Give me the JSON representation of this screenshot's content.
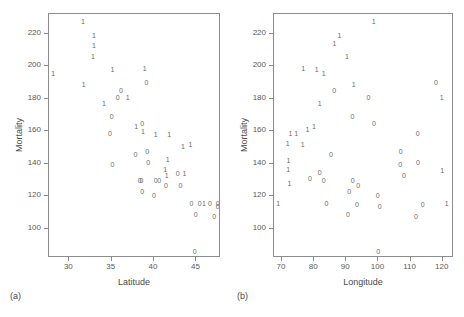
{
  "figure": {
    "background": "#ffffff",
    "axis_color": "#8c8c8c",
    "marker_color": "#6b6b6b",
    "text_color": "#4a4a4a"
  },
  "panels": [
    {
      "key": "a",
      "label": "(a)"
    },
    {
      "key": "b",
      "label": "(b)"
    }
  ],
  "chart_data": [
    {
      "type": "scatter",
      "panel": "(a)",
      "title": "",
      "xlabel": "Latitude",
      "ylabel": "Mortality",
      "xlim": [
        27.6,
        47.9
      ],
      "ylim": [
        82,
        232
      ],
      "xticks": [
        30,
        35,
        40,
        45
      ],
      "xticklabels": [
        "30",
        "35",
        "40",
        "45"
      ],
      "yticks": [
        100,
        120,
        140,
        160,
        180,
        200,
        220
      ],
      "yticklabels": [
        "100",
        "120",
        "140",
        "160",
        "180",
        "200",
        "220"
      ],
      "grid": false,
      "legend": "none",
      "marker_encoding": {
        "1": "group 1 (text glyph '1')",
        "0": "group 0 (text glyph '0')"
      },
      "points": [
        {
          "x": 31.6,
          "y": 228,
          "m": "1"
        },
        {
          "x": 32.9,
          "y": 219,
          "m": "1"
        },
        {
          "x": 32.9,
          "y": 213,
          "m": "1"
        },
        {
          "x": 32.8,
          "y": 206,
          "m": "1"
        },
        {
          "x": 28.1,
          "y": 196,
          "m": "1"
        },
        {
          "x": 35.1,
          "y": 198,
          "m": "1"
        },
        {
          "x": 38.9,
          "y": 199,
          "m": "1"
        },
        {
          "x": 31.7,
          "y": 189,
          "m": "1"
        },
        {
          "x": 39.1,
          "y": 190,
          "m": "0"
        },
        {
          "x": 36.1,
          "y": 185,
          "m": "0"
        },
        {
          "x": 35.7,
          "y": 181,
          "m": "0"
        },
        {
          "x": 36.9,
          "y": 181,
          "m": "1"
        },
        {
          "x": 34.1,
          "y": 177,
          "m": "1"
        },
        {
          "x": 35.0,
          "y": 169,
          "m": "0"
        },
        {
          "x": 38.6,
          "y": 165,
          "m": "0"
        },
        {
          "x": 37.9,
          "y": 163,
          "m": "1"
        },
        {
          "x": 38.7,
          "y": 160,
          "m": "1"
        },
        {
          "x": 34.8,
          "y": 159,
          "m": "0"
        },
        {
          "x": 40.2,
          "y": 158,
          "m": "1"
        },
        {
          "x": 41.8,
          "y": 158,
          "m": "1"
        },
        {
          "x": 43.4,
          "y": 151,
          "m": "1"
        },
        {
          "x": 44.3,
          "y": 152,
          "m": "1"
        },
        {
          "x": 39.2,
          "y": 148,
          "m": "0"
        },
        {
          "x": 37.8,
          "y": 146,
          "m": "0"
        },
        {
          "x": 41.6,
          "y": 143,
          "m": "1"
        },
        {
          "x": 39.3,
          "y": 141,
          "m": "0"
        },
        {
          "x": 35.1,
          "y": 140,
          "m": "0"
        },
        {
          "x": 41.3,
          "y": 137,
          "m": "1"
        },
        {
          "x": 42.8,
          "y": 134,
          "m": "0"
        },
        {
          "x": 43.6,
          "y": 134,
          "m": "1"
        },
        {
          "x": 41.5,
          "y": 133,
          "m": "1"
        },
        {
          "x": 38.3,
          "y": 130,
          "m": "0"
        },
        {
          "x": 40.2,
          "y": 130,
          "m": "0"
        },
        {
          "x": 40.6,
          "y": 130,
          "m": "0"
        },
        {
          "x": 38.5,
          "y": 130,
          "m": "0"
        },
        {
          "x": 41.4,
          "y": 127,
          "m": "0"
        },
        {
          "x": 43.1,
          "y": 127,
          "m": "0"
        },
        {
          "x": 38.6,
          "y": 123,
          "m": "0"
        },
        {
          "x": 40.0,
          "y": 121,
          "m": "0"
        },
        {
          "x": 44.4,
          "y": 116,
          "m": "0"
        },
        {
          "x": 45.4,
          "y": 116,
          "m": "0"
        },
        {
          "x": 45.9,
          "y": 116,
          "m": "1"
        },
        {
          "x": 46.6,
          "y": 116,
          "m": "0"
        },
        {
          "x": 47.5,
          "y": 116,
          "m": "0"
        },
        {
          "x": 47.5,
          "y": 114,
          "m": "0"
        },
        {
          "x": 44.9,
          "y": 109,
          "m": "0"
        },
        {
          "x": 47.1,
          "y": 108,
          "m": "0"
        },
        {
          "x": 44.8,
          "y": 86,
          "m": "0"
        }
      ]
    },
    {
      "type": "scatter",
      "panel": "(b)",
      "title": "",
      "xlabel": "Longitude",
      "ylabel": "Mortality",
      "xlim": [
        67.5,
        123.5
      ],
      "ylim": [
        82,
        232
      ],
      "xticks": [
        70,
        80,
        90,
        100,
        110,
        120
      ],
      "xticklabels": [
        "70",
        "80",
        "90",
        "100",
        "110",
        "120"
      ],
      "yticks": [
        100,
        120,
        140,
        160,
        180,
        200,
        220
      ],
      "yticklabels": [
        "100",
        "120",
        "140",
        "160",
        "180",
        "200",
        "220"
      ],
      "grid": false,
      "legend": "none",
      "marker_encoding": {
        "1": "group 1 (text glyph '1')",
        "0": "group 0 (text glyph '0')"
      },
      "points": [
        {
          "x": 98.5,
          "y": 228,
          "m": "1"
        },
        {
          "x": 87.9,
          "y": 219,
          "m": "1"
        },
        {
          "x": 86.3,
          "y": 214,
          "m": "1"
        },
        {
          "x": 90.2,
          "y": 206,
          "m": "1"
        },
        {
          "x": 76.6,
          "y": 199,
          "m": "1"
        },
        {
          "x": 80.8,
          "y": 198,
          "m": "1"
        },
        {
          "x": 83.0,
          "y": 196,
          "m": "1"
        },
        {
          "x": 92.3,
          "y": 189,
          "m": "1"
        },
        {
          "x": 117.9,
          "y": 190,
          "m": "0"
        },
        {
          "x": 86.2,
          "y": 185,
          "m": "0"
        },
        {
          "x": 96.9,
          "y": 181,
          "m": "0"
        },
        {
          "x": 119.7,
          "y": 181,
          "m": "1"
        },
        {
          "x": 81.7,
          "y": 177,
          "m": "1"
        },
        {
          "x": 91.9,
          "y": 169,
          "m": "0"
        },
        {
          "x": 98.6,
          "y": 165,
          "m": "0"
        },
        {
          "x": 79.9,
          "y": 163,
          "m": "1"
        },
        {
          "x": 77.9,
          "y": 161,
          "m": "1"
        },
        {
          "x": 72.6,
          "y": 159,
          "m": "1"
        },
        {
          "x": 74.4,
          "y": 159,
          "m": "1"
        },
        {
          "x": 112.2,
          "y": 159,
          "m": "0"
        },
        {
          "x": 71.8,
          "y": 153,
          "m": "1"
        },
        {
          "x": 76.4,
          "y": 152,
          "m": "1"
        },
        {
          "x": 106.9,
          "y": 148,
          "m": "0"
        },
        {
          "x": 85.2,
          "y": 146,
          "m": "0"
        },
        {
          "x": 72.0,
          "y": 142,
          "m": "1"
        },
        {
          "x": 112.3,
          "y": 141,
          "m": "0"
        },
        {
          "x": 106.8,
          "y": 140,
          "m": "0"
        },
        {
          "x": 71.9,
          "y": 137,
          "m": "1"
        },
        {
          "x": 119.8,
          "y": 136,
          "m": "1"
        },
        {
          "x": 81.7,
          "y": 135,
          "m": "0"
        },
        {
          "x": 107.9,
          "y": 133,
          "m": "0"
        },
        {
          "x": 78.7,
          "y": 131,
          "m": "0"
        },
        {
          "x": 83.0,
          "y": 130,
          "m": "0"
        },
        {
          "x": 92.0,
          "y": 130,
          "m": "0"
        },
        {
          "x": 72.3,
          "y": 128,
          "m": "1"
        },
        {
          "x": 93.7,
          "y": 127,
          "m": "0"
        },
        {
          "x": 90.9,
          "y": 123,
          "m": "0"
        },
        {
          "x": 99.8,
          "y": 121,
          "m": "0"
        },
        {
          "x": 68.8,
          "y": 116,
          "m": "1"
        },
        {
          "x": 83.8,
          "y": 116,
          "m": "0"
        },
        {
          "x": 93.3,
          "y": 115,
          "m": "0"
        },
        {
          "x": 100.4,
          "y": 114,
          "m": "0"
        },
        {
          "x": 113.8,
          "y": 115,
          "m": "0"
        },
        {
          "x": 121.2,
          "y": 116,
          "m": "1"
        },
        {
          "x": 90.5,
          "y": 109,
          "m": "0"
        },
        {
          "x": 111.7,
          "y": 108,
          "m": "0"
        },
        {
          "x": 99.9,
          "y": 86,
          "m": "0"
        }
      ]
    }
  ]
}
